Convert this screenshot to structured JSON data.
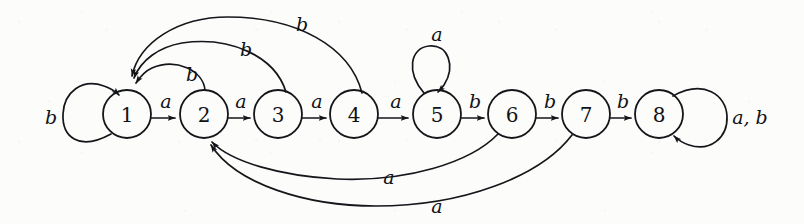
{
  "figure": {
    "kind": "state-transition-diagram",
    "background_color": "#fcfcfb",
    "ink_color": "#15161a",
    "width": 804,
    "height": 224
  },
  "states": [
    {
      "id": "1",
      "label": "1",
      "cx": 127,
      "cy": 114,
      "r": 24
    },
    {
      "id": "2",
      "label": "2",
      "cx": 204,
      "cy": 114,
      "r": 24
    },
    {
      "id": "3",
      "label": "3",
      "cx": 278,
      "cy": 114,
      "r": 24
    },
    {
      "id": "4",
      "label": "4",
      "cx": 354,
      "cy": 114,
      "r": 24
    },
    {
      "id": "5",
      "label": "5",
      "cx": 437,
      "cy": 114,
      "r": 24
    },
    {
      "id": "6",
      "label": "6",
      "cx": 512,
      "cy": 114,
      "r": 24
    },
    {
      "id": "7",
      "label": "7",
      "cx": 586,
      "cy": 114,
      "r": 24
    },
    {
      "id": "8",
      "label": "8",
      "cx": 659,
      "cy": 114,
      "r": 24
    }
  ],
  "transitions": [
    {
      "id": "t-1-1",
      "from": "1",
      "to": "1",
      "symbol": "b",
      "label_x": 51,
      "label_y": 117,
      "kind": "self-loop-left"
    },
    {
      "id": "t-1-2",
      "from": "1",
      "to": "2",
      "symbol": "a",
      "label_x": 166,
      "label_y": 101,
      "kind": "straight"
    },
    {
      "id": "t-2-3",
      "from": "2",
      "to": "3",
      "symbol": "a",
      "label_x": 241,
      "label_y": 101,
      "kind": "straight"
    },
    {
      "id": "t-3-4",
      "from": "3",
      "to": "4",
      "symbol": "a",
      "label_x": 317,
      "label_y": 101,
      "kind": "straight"
    },
    {
      "id": "t-4-5",
      "from": "4",
      "to": "5",
      "symbol": "a",
      "label_x": 396,
      "label_y": 101,
      "kind": "straight"
    },
    {
      "id": "t-5-6",
      "from": "5",
      "to": "6",
      "symbol": "b",
      "label_x": 475,
      "label_y": 101,
      "kind": "straight"
    },
    {
      "id": "t-6-7",
      "from": "6",
      "to": "7",
      "symbol": "b",
      "label_x": 550,
      "label_y": 101,
      "kind": "straight"
    },
    {
      "id": "t-7-8",
      "from": "7",
      "to": "8",
      "symbol": "b",
      "label_x": 623,
      "label_y": 101,
      "kind": "straight"
    },
    {
      "id": "t-2-1",
      "from": "2",
      "to": "1",
      "symbol": "b",
      "label_x": 192,
      "label_y": 74,
      "kind": "arc-above-small"
    },
    {
      "id": "t-3-1",
      "from": "3",
      "to": "1",
      "symbol": "b",
      "label_x": 246,
      "label_y": 49,
      "kind": "arc-above-medium"
    },
    {
      "id": "t-4-1",
      "from": "4",
      "to": "1",
      "symbol": "b",
      "label_x": 302,
      "label_y": 24,
      "kind": "arc-above-large"
    },
    {
      "id": "t-5-5",
      "from": "5",
      "to": "5",
      "symbol": "a",
      "label_x": 437,
      "label_y": 34,
      "kind": "self-loop-top"
    },
    {
      "id": "t-6-2",
      "from": "6",
      "to": "2",
      "symbol": "a",
      "label_x": 389,
      "label_y": 177,
      "kind": "arc-below-upper"
    },
    {
      "id": "t-7-2",
      "from": "7",
      "to": "2",
      "symbol": "a",
      "label_x": 437,
      "label_y": 206,
      "kind": "arc-below-lower"
    },
    {
      "id": "t-8-8",
      "from": "8",
      "to": "8",
      "symbol": "a, b",
      "label_x": 750,
      "label_y": 117,
      "kind": "self-loop-right"
    }
  ]
}
